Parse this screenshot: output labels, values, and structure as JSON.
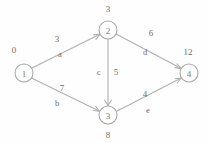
{
  "diagram": {
    "colors": {
      "stroke": "#b0b0b0",
      "node_stroke": "#a8a8a8",
      "text": "#6e6e6e",
      "background": "#fefefe"
    },
    "nodes": [
      {
        "id": "1",
        "label": "1",
        "distance": "0",
        "cx": 24,
        "cy": 73,
        "r": 9,
        "dist_x": 14,
        "dist_y": 50
      },
      {
        "id": "2",
        "label": "2",
        "distance": "3",
        "cx": 108,
        "cy": 30,
        "r": 9,
        "dist_x": 108,
        "dist_y": 9
      },
      {
        "id": "3",
        "label": "3",
        "distance": "8",
        "cx": 108,
        "cy": 115,
        "r": 9,
        "dist_x": 108,
        "dist_y": 135
      },
      {
        "id": "4",
        "label": "4",
        "distance": "12",
        "cx": 189,
        "cy": 73,
        "r": 9,
        "dist_x": 188,
        "dist_y": 52
      }
    ],
    "edges": [
      {
        "name": "a",
        "from": "1",
        "to": "2",
        "weight": "3",
        "weight_x": 57,
        "weight_y": 39,
        "name_x": 60,
        "name_y": 54
      },
      {
        "name": "b",
        "from": "1",
        "to": "3",
        "weight": "7",
        "weight_x": 62,
        "weight_y": 88,
        "name_x": 57,
        "name_y": 103
      },
      {
        "name": "c",
        "from": "2",
        "to": "3",
        "weight": "5",
        "weight_x": 116,
        "weight_y": 72,
        "name_x": 99,
        "name_y": 72
      },
      {
        "name": "d",
        "from": "2",
        "to": "4",
        "weight": "6",
        "weight_x": 151,
        "weight_y": 33,
        "name_x": 145,
        "name_y": 52
      },
      {
        "name": "e",
        "from": "3",
        "to": "4",
        "weight": "4",
        "weight_x": 145,
        "weight_y": 94,
        "name_x": 148,
        "name_y": 110
      }
    ]
  }
}
